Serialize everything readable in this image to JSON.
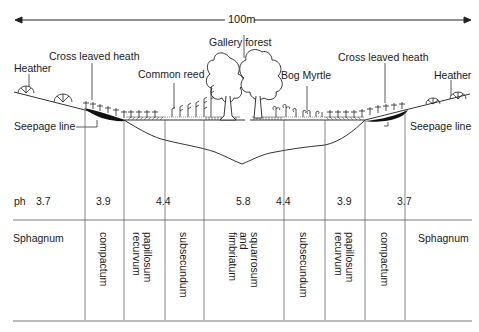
{
  "scale": {
    "label": "100m"
  },
  "labels": {
    "heather_left": "Heather",
    "cross_leaved_heath_left": "Cross leaved heath",
    "common_reed": "Common reed",
    "gallery_forest": "Gallery forest",
    "bog_myrtle": "Bog Myrtle",
    "cross_leaved_heath_right": "Cross leaved heath",
    "heather_right": "Heather",
    "seepage_line_left": "Seepage line",
    "seepage_line_right": "Seepage line"
  },
  "ph": {
    "label": "ph",
    "values": [
      "3.7",
      "3.9",
      "4.4",
      "5.8",
      "4.4",
      "3.9",
      "3.7"
    ]
  },
  "sphagnum": {
    "left": "Sphagnum",
    "right": "Sphagnum",
    "columns": [
      "compactum",
      "papillosum\nrecurvum",
      "subsecundum",
      "squarrosum\nand\nfimbriatum",
      "subsecundum",
      "papillosum\nrecurvum",
      "compactum"
    ]
  },
  "colors": {
    "line": "#444444",
    "ink": "#111111"
  }
}
